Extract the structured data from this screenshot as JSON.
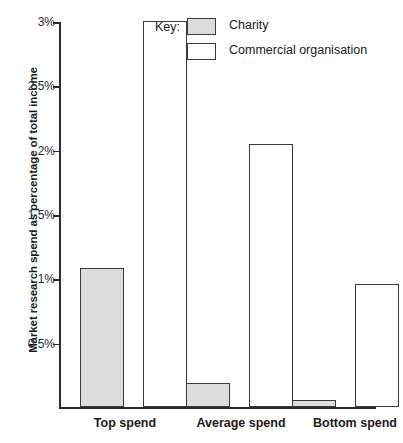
{
  "chart_data": {
    "type": "bar",
    "title": "",
    "xlabel": "",
    "ylabel": "Market research spend as percentage of total income",
    "categories": [
      "Top spend",
      "Average spend",
      "Bottom spend"
    ],
    "series": [
      {
        "name": "Charity",
        "values": [
          1.08,
          0.18,
          0.05
        ],
        "color": "#dcdcdc"
      },
      {
        "name": "Commercial organisation",
        "values": [
          3.0,
          2.04,
          0.95
        ],
        "color": "#ffffff"
      }
    ],
    "ylim": [
      0,
      3
    ],
    "yticks": [
      0.5,
      1,
      1.5,
      2,
      2.5,
      3
    ],
    "ytick_labels": [
      "0.5%",
      "1%",
      "1.5%",
      "2%",
      "2.5%",
      "3%"
    ],
    "grid": false,
    "legend_position": "top-right",
    "legend_title": "Key:"
  },
  "legend": {
    "title": "Key:",
    "entries": [
      {
        "label": "Charity",
        "swatch": "charity"
      },
      {
        "label": "Commercial organisation",
        "swatch": "commercial"
      }
    ]
  },
  "axes": {
    "y_title": "Market research spend as percentage of total income",
    "y_ticks": [
      "3%",
      "2.5%",
      "2%",
      "1.5%",
      "1%",
      "0.5%"
    ],
    "x_labels": [
      "Top spend",
      "Average spend",
      "Bottom spend"
    ]
  },
  "colors": {
    "charity_fill": "#dcdcdc",
    "commercial_fill": "#ffffff",
    "outline": "#3a3a3a",
    "axis": "#2b2b2b",
    "background": "#ffffff"
  }
}
